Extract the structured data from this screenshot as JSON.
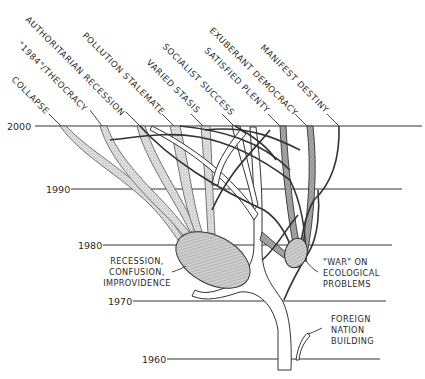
{
  "diagram": {
    "years": [
      {
        "label": "2000",
        "y": 126
      },
      {
        "label": "1990",
        "y": 189
      },
      {
        "label": "1980",
        "y": 245
      },
      {
        "label": "1970",
        "y": 301
      },
      {
        "label": "1960",
        "y": 359
      }
    ],
    "outcomes": [
      {
        "label": "COLLAPSE"
      },
      {
        "label": "\"1984\"/THEOCRACY"
      },
      {
        "label": "AUTHORITARIAN RECESSION"
      },
      {
        "label": "POLLUTION STALEMATE"
      },
      {
        "label": "VARIED STASIS"
      },
      {
        "label": "SOCIALIST SUCCESS"
      },
      {
        "label": "SATISFIED PLENTY"
      },
      {
        "label": "EXUBERANT DEMOCRACY"
      },
      {
        "label": "MANIFEST DESTINY"
      }
    ],
    "nodes": {
      "recession": {
        "lines": [
          "RECESSION,",
          "CONFUSION,",
          "IMPROVIDENCE"
        ]
      },
      "war": {
        "lines": [
          "\"WAR\" ON",
          "ECOLOGICAL",
          "PROBLEMS"
        ]
      },
      "foreign": {
        "lines": [
          "FOREIGN",
          "NATION",
          "BUILDING"
        ]
      }
    }
  }
}
